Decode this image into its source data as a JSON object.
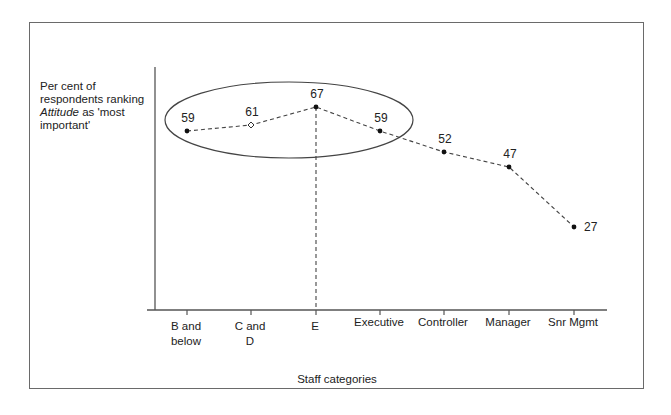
{
  "chart_data": {
    "type": "line",
    "title": "",
    "xlabel": "Staff categories",
    "ylabel": "Per cent of respondents ranking Attitude as 'most important'",
    "ylabel_lines": [
      {
        "text": "Per cent of",
        "italic_prefix": ""
      },
      {
        "text": "respondents ranking",
        "italic_prefix": ""
      },
      {
        "text": " as 'most",
        "italic_prefix": "Attitude"
      },
      {
        "text": "important'",
        "italic_prefix": ""
      }
    ],
    "categories": [
      "B and below",
      "C and D",
      "E",
      "Executive",
      "Controller",
      "Manager",
      "Snr Mgmt"
    ],
    "category_label_lines": [
      [
        "B  and",
        "below"
      ],
      [
        "C and",
        "D"
      ],
      [
        "E"
      ],
      [
        "Executive"
      ],
      [
        "Controller"
      ],
      [
        "Manager"
      ],
      [
        "Snr Mgmt"
      ]
    ],
    "series": [
      {
        "name": "Attitude ranked most important (%)",
        "values": [
          59,
          61,
          67,
          59,
          52,
          47,
          27
        ],
        "line_style": "dashed",
        "markers": [
          "dot",
          "hollow-diamond",
          "dot",
          "dot",
          "dot",
          "dot",
          "dot"
        ]
      }
    ],
    "data_labels": [
      "59",
      "61",
      "67",
      "59",
      "52",
      "47",
      "27"
    ],
    "annotations": [
      {
        "type": "ellipse",
        "encloses": [
          "B and below",
          "C and D",
          "E",
          "Executive"
        ]
      },
      {
        "type": "vertical-dashed-line",
        "at": "E",
        "from_value": 67,
        "to": "x-axis"
      }
    ],
    "y_ticks": [],
    "grid": false,
    "legend": null,
    "colors": {
      "line": "#333333",
      "axis": "#555555",
      "frame": "#6a6a6a",
      "text": "#222222"
    }
  }
}
